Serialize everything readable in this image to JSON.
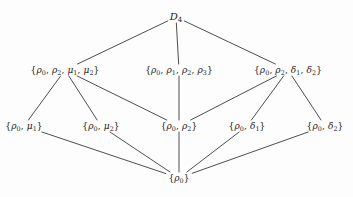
{
  "figure": {
    "type": "hasse-diagram",
    "background_color": "#fdfdfd",
    "line_color": "#3a3a3a",
    "text_color": "#1b1b1b"
  },
  "nodes": [
    {
      "id": "d4",
      "label": "D4",
      "parts": [
        {
          "t": "D",
          "italic": true
        },
        {
          "t": "4",
          "sub": true
        }
      ],
      "x": 176,
      "y": 17,
      "level": 0
    },
    {
      "id": "mu-group",
      "label": "{ρ₀, ρ₂, μ₁, μ₂}",
      "parts": [
        {
          "t": "{",
          "brace": true
        },
        {
          "t": "ρ",
          "italic": true
        },
        {
          "t": "0",
          "sub": true
        },
        {
          "t": ", ",
          "comma": true
        },
        {
          "t": "ρ",
          "italic": true
        },
        {
          "t": "2",
          "sub": true
        },
        {
          "t": ", ",
          "comma": true
        },
        {
          "t": "μ",
          "italic": true
        },
        {
          "t": "1",
          "sub": true
        },
        {
          "t": ", ",
          "comma": true
        },
        {
          "t": "μ",
          "italic": true
        },
        {
          "t": "2",
          "sub": true
        },
        {
          "t": "}",
          "brace": true
        }
      ],
      "x": 65,
      "y": 70,
      "level": 1
    },
    {
      "id": "rho-group",
      "label": "{ρ₀, ρ₁, ρ₂, ρ₃}",
      "parts": [
        {
          "t": "{",
          "brace": true
        },
        {
          "t": "ρ",
          "italic": true
        },
        {
          "t": "0",
          "sub": true
        },
        {
          "t": ", ",
          "comma": true
        },
        {
          "t": "ρ",
          "italic": true
        },
        {
          "t": "1",
          "sub": true
        },
        {
          "t": ", ",
          "comma": true
        },
        {
          "t": "ρ",
          "italic": true
        },
        {
          "t": "2",
          "sub": true
        },
        {
          "t": ", ",
          "comma": true
        },
        {
          "t": "ρ",
          "italic": true
        },
        {
          "t": "3",
          "sub": true
        },
        {
          "t": "}",
          "brace": true
        }
      ],
      "x": 179,
      "y": 70,
      "level": 1
    },
    {
      "id": "delta-group",
      "label": "{ρ₀, ρ₂, δ₁, δ₂}",
      "parts": [
        {
          "t": "{",
          "brace": true
        },
        {
          "t": "ρ",
          "italic": true
        },
        {
          "t": "0",
          "sub": true
        },
        {
          "t": ", ",
          "comma": true
        },
        {
          "t": "ρ",
          "italic": true
        },
        {
          "t": "2",
          "sub": true
        },
        {
          "t": ", ",
          "comma": true
        },
        {
          "t": "δ",
          "italic": true
        },
        {
          "t": "1",
          "sub": true
        },
        {
          "t": ", ",
          "comma": true
        },
        {
          "t": "δ",
          "italic": true
        },
        {
          "t": "2",
          "sub": true
        },
        {
          "t": "}",
          "brace": true
        }
      ],
      "x": 288,
      "y": 70,
      "level": 1
    },
    {
      "id": "mu1",
      "label": "{ρ₀, μ₁}",
      "parts": [
        {
          "t": "{",
          "brace": true
        },
        {
          "t": "ρ",
          "italic": true
        },
        {
          "t": "0",
          "sub": true
        },
        {
          "t": ", ",
          "comma": true
        },
        {
          "t": "μ",
          "italic": true
        },
        {
          "t": "1",
          "sub": true
        },
        {
          "t": "}",
          "brace": true
        }
      ],
      "x": 24,
      "y": 126,
      "level": 2
    },
    {
      "id": "mu2",
      "label": "{ρ₀, μ₂}",
      "parts": [
        {
          "t": "{",
          "brace": true
        },
        {
          "t": "ρ",
          "italic": true
        },
        {
          "t": "0",
          "sub": true
        },
        {
          "t": ", ",
          "comma": true
        },
        {
          "t": "μ",
          "italic": true
        },
        {
          "t": "2",
          "sub": true
        },
        {
          "t": "}",
          "brace": true
        }
      ],
      "x": 101,
      "y": 126,
      "level": 2
    },
    {
      "id": "rho2",
      "label": "{ρ₀, ρ₂}",
      "parts": [
        {
          "t": "{",
          "brace": true
        },
        {
          "t": "ρ",
          "italic": true
        },
        {
          "t": "0",
          "sub": true
        },
        {
          "t": ", ",
          "comma": true
        },
        {
          "t": "ρ",
          "italic": true
        },
        {
          "t": "2",
          "sub": true
        },
        {
          "t": "}",
          "brace": true
        }
      ],
      "x": 179,
      "y": 126,
      "level": 2
    },
    {
      "id": "delta1",
      "label": "{ρ₀, δ₁}",
      "parts": [
        {
          "t": "{",
          "brace": true
        },
        {
          "t": "ρ",
          "italic": true
        },
        {
          "t": "0",
          "sub": true
        },
        {
          "t": ", ",
          "comma": true
        },
        {
          "t": "δ",
          "italic": true
        },
        {
          "t": "1",
          "sub": true
        },
        {
          "t": "}",
          "brace": true
        }
      ],
      "x": 247,
      "y": 126,
      "level": 2
    },
    {
      "id": "delta2",
      "label": "{ρ₀, δ₂}",
      "parts": [
        {
          "t": "{",
          "brace": true
        },
        {
          "t": "ρ",
          "italic": true
        },
        {
          "t": "0",
          "sub": true
        },
        {
          "t": ", ",
          "comma": true
        },
        {
          "t": "δ",
          "italic": true
        },
        {
          "t": "2",
          "sub": true
        },
        {
          "t": "}",
          "brace": true
        }
      ],
      "x": 325,
      "y": 126,
      "level": 2
    },
    {
      "id": "identity",
      "label": "{ρ₀}",
      "parts": [
        {
          "t": "{",
          "brace": true
        },
        {
          "t": "ρ",
          "italic": true
        },
        {
          "t": "0",
          "sub": true
        },
        {
          "t": "}",
          "brace": true
        }
      ],
      "x": 179,
      "y": 178,
      "level": 3
    }
  ],
  "edges": [
    {
      "from": "d4",
      "to": "mu-group"
    },
    {
      "from": "d4",
      "to": "rho-group"
    },
    {
      "from": "d4",
      "to": "delta-group"
    },
    {
      "from": "mu-group",
      "to": "mu1"
    },
    {
      "from": "mu-group",
      "to": "mu2"
    },
    {
      "from": "mu-group",
      "to": "rho2"
    },
    {
      "from": "rho-group",
      "to": "rho2"
    },
    {
      "from": "delta-group",
      "to": "rho2"
    },
    {
      "from": "delta-group",
      "to": "delta1"
    },
    {
      "from": "delta-group",
      "to": "delta2"
    },
    {
      "from": "mu1",
      "to": "identity"
    },
    {
      "from": "mu2",
      "to": "identity"
    },
    {
      "from": "rho2",
      "to": "identity"
    },
    {
      "from": "delta1",
      "to": "identity"
    },
    {
      "from": "delta2",
      "to": "identity"
    }
  ]
}
